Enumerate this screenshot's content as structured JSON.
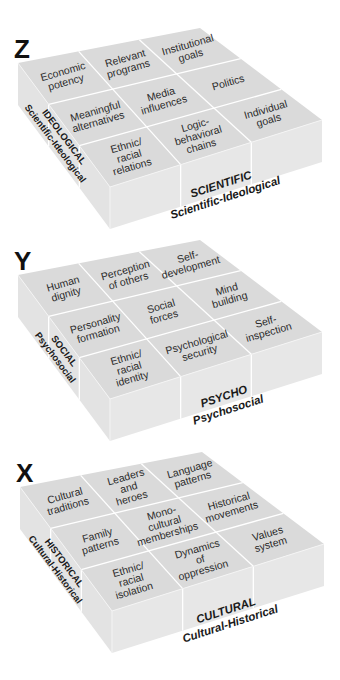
{
  "figure": {
    "cubes": [
      {
        "letter": "Z",
        "front_label": {
          "title": "SCIENTIFIC",
          "subtitle": "Scientific-Ideological"
        },
        "side_label": {
          "title": "IDEOLOGICAL",
          "subtitle": "Scientific-Ideological"
        },
        "cells": [
          [
            "Economic|potency",
            "Relevant|programs",
            "Institutional|goals"
          ],
          [
            "Meaningful|alternatives",
            "Media|influences",
            "Politics"
          ],
          [
            "Ethnic/|racial|relations",
            "Logic-|behavioral|chains",
            "Individual|goals"
          ]
        ]
      },
      {
        "letter": "Y",
        "front_label": {
          "title": "PSYCHO",
          "subtitle": "Psychosocial"
        },
        "side_label": {
          "title": "SOCIAL",
          "subtitle": "Psychosocial"
        },
        "cells": [
          [
            "Human|dignity",
            "Perception|of others",
            "Self-|development"
          ],
          [
            "Personality|formation",
            "Social|forces",
            "Mind|building"
          ],
          [
            "Ethnic/|racial|identity",
            "Psychological|security",
            "Self-|inspection"
          ]
        ]
      },
      {
        "letter": "X",
        "front_label": {
          "title": "CULTURAL",
          "subtitle": "Cultural-Historical"
        },
        "side_label": {
          "title": "HISTORICAL",
          "subtitle": "Cultural-Historical"
        },
        "cells": [
          [
            "Cultural|traditions",
            "Leaders|and|heroes",
            "Language|patterns"
          ],
          [
            "Family|patterns",
            "Mono-|cultural|memberships",
            "Historical|movements"
          ],
          [
            "Ethnic/|racial|isolation",
            "Dynamics|of|oppression",
            "Values|system"
          ]
        ]
      }
    ],
    "colors": {
      "top_face": "#dadada",
      "left_face": "#e3e3e3",
      "right_face": "#e7e7e7",
      "grid_lines": "#ffffff",
      "text": "#2a2a2a"
    }
  }
}
